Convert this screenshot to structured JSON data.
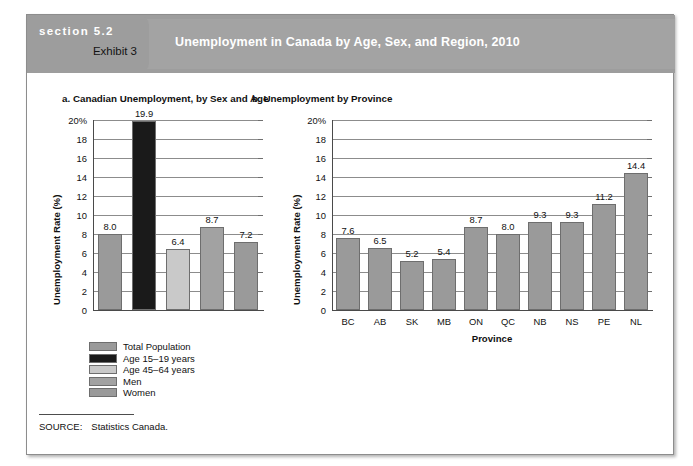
{
  "header": {
    "section_label": "section 5.2",
    "exhibit_label": "Exhibit 3",
    "title": "Unemployment in Canada by Age, Sex, and Region, 2010",
    "band_color": "#9d9d9d",
    "title_color": "#ffffff"
  },
  "panels": {
    "a_title": "a. Canadian Unemployment, by Sex and Age",
    "b_title": "b. Unemployment by Province"
  },
  "source": {
    "label": "SOURCE:",
    "text": "Statistics Canada."
  },
  "legend": {
    "items": [
      {
        "label": "Total Population",
        "color": "#9a9a9a"
      },
      {
        "label": "Age 15–19 years",
        "color": "#1a1a1a"
      },
      {
        "label": "Age 45–64 years",
        "color": "#c9c9c9"
      },
      {
        "label": "Men",
        "color": "#a2a2a2"
      },
      {
        "label": "Women",
        "color": "#9a9a9a"
      }
    ]
  },
  "chart_data": [
    {
      "type": "bar",
      "id": "panel-a",
      "title": "a. Canadian Unemployment, by Sex and Age",
      "xlabel": "",
      "ylabel": "Unemployment Rate (%)",
      "ylim": [
        0,
        20
      ],
      "yticks": [
        0,
        2,
        4,
        6,
        8,
        10,
        12,
        14,
        16,
        18,
        20
      ],
      "ytick_labels": [
        "0",
        "2",
        "4",
        "6",
        "8",
        "10",
        "12",
        "14",
        "16",
        "18",
        "20%"
      ],
      "grid": true,
      "legend_position": "below-plot",
      "categories": [
        "Total Population",
        "Age 15–19 years",
        "Age 45–64 years",
        "Men",
        "Women"
      ],
      "values": [
        8.0,
        19.9,
        6.4,
        8.7,
        7.2
      ],
      "data_labels": [
        "8.0",
        "19.9",
        "6.4",
        "8.7",
        "7.2"
      ],
      "bar_colors": [
        "#9a9a9a",
        "#1a1a1a",
        "#c9c9c9",
        "#a2a2a2",
        "#9a9a9a"
      ],
      "xtick_labels": [
        "",
        "",
        "",
        "",
        ""
      ]
    },
    {
      "type": "bar",
      "id": "panel-b",
      "title": "b. Unemployment by Province",
      "xlabel": "Province",
      "ylabel": "Unemployment Rate (%)",
      "ylim": [
        0,
        20
      ],
      "yticks": [
        0,
        2,
        4,
        6,
        8,
        10,
        12,
        14,
        16,
        18,
        20
      ],
      "ytick_labels": [
        "0",
        "2",
        "4",
        "6",
        "8",
        "10",
        "12",
        "14",
        "16",
        "18",
        "20%"
      ],
      "grid": true,
      "legend_position": "none",
      "categories": [
        "BC",
        "AB",
        "SK",
        "MB",
        "ON",
        "QC",
        "NB",
        "NS",
        "PE",
        "NL"
      ],
      "values": [
        7.6,
        6.5,
        5.2,
        5.4,
        8.7,
        8.0,
        9.3,
        9.3,
        11.2,
        14.4
      ],
      "data_labels": [
        "7.6",
        "6.5",
        "5.2",
        "5.4",
        "8.7",
        "8.0",
        "9.3",
        "9.3",
        "11.2",
        "14.4"
      ],
      "bar_colors": [
        "#9a9a9a",
        "#9a9a9a",
        "#9a9a9a",
        "#9a9a9a",
        "#9a9a9a",
        "#9a9a9a",
        "#9a9a9a",
        "#9a9a9a",
        "#9a9a9a",
        "#9a9a9a"
      ],
      "xtick_labels": [
        "BC",
        "AB",
        "SK",
        "MB",
        "ON",
        "QC",
        "NB",
        "NS",
        "PE",
        "NL"
      ]
    }
  ]
}
